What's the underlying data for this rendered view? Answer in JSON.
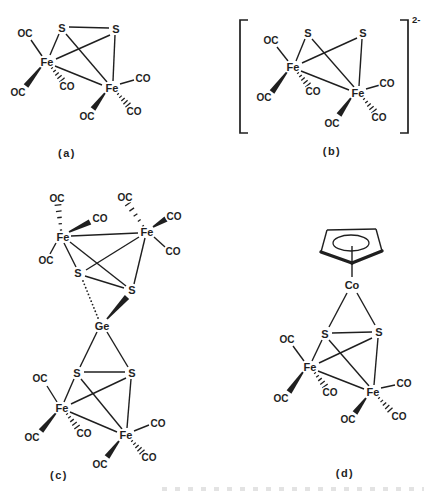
{
  "page": {
    "background": "#ffffff",
    "ink": "#1f1f1f",
    "artifact_color": "#c9c9c9"
  },
  "figure": {
    "type": "chemical-structure-diagram",
    "structures": [
      {
        "id": "a",
        "caption": "(a)",
        "caption_pos": [
          67,
          153
        ],
        "atoms": [
          {
            "t": "S",
            "x": 62,
            "y": 28,
            "k": "atom"
          },
          {
            "t": "S",
            "x": 116,
            "y": 29,
            "k": "atom"
          },
          {
            "t": "Fe",
            "x": 47,
            "y": 62,
            "k": "atom"
          },
          {
            "t": "Fe",
            "x": 112,
            "y": 88,
            "k": "atom"
          },
          {
            "t": "OC",
            "x": 25,
            "y": 33,
            "k": "lig"
          },
          {
            "t": "OC",
            "x": 18,
            "y": 92,
            "k": "lig"
          },
          {
            "t": "CO",
            "x": 67,
            "y": 86,
            "k": "lig"
          },
          {
            "t": "CO",
            "x": 143,
            "y": 78,
            "k": "lig"
          },
          {
            "t": "OC",
            "x": 87,
            "y": 116,
            "k": "lig"
          },
          {
            "t": "CO",
            "x": 134,
            "y": 111,
            "k": "lig"
          }
        ],
        "bonds": [
          [
            69,
            27,
            109,
            28,
            "plain"
          ],
          [
            59,
            34,
            50,
            55,
            "plain"
          ],
          [
            66,
            34,
            107,
            82,
            "plain"
          ],
          [
            110,
            35,
            56,
            59,
            "plain"
          ],
          [
            115,
            35,
            113,
            81,
            "plain"
          ],
          [
            55,
            66,
            102,
            85,
            "plain"
          ],
          [
            42,
            56,
            31,
            40,
            "plain"
          ],
          [
            41,
            67,
            26,
            86,
            "bold"
          ],
          [
            52,
            68,
            62,
            80,
            "hash"
          ],
          [
            120,
            84,
            134,
            80,
            "plain"
          ],
          [
            105,
            93,
            93,
            109,
            "bold"
          ],
          [
            118,
            94,
            128,
            105,
            "hash"
          ]
        ]
      },
      {
        "id": "b",
        "caption": "(b)",
        "caption_pos": [
          332,
          151
        ],
        "charge": {
          "text": "2-",
          "pos": [
            412,
            19
          ]
        },
        "brackets": [
          {
            "x": 240,
            "y1": 20,
            "y2": 133,
            "dir": 1
          },
          {
            "x": 408,
            "y1": 20,
            "y2": 133,
            "dir": -1
          }
        ],
        "atoms": [
          {
            "t": "S",
            "x": 308,
            "y": 33,
            "k": "atom"
          },
          {
            "t": "S",
            "x": 363,
            "y": 33,
            "k": "atom"
          },
          {
            "t": "Fe",
            "x": 293,
            "y": 67,
            "k": "atom"
          },
          {
            "t": "Fe",
            "x": 358,
            "y": 93,
            "k": "atom"
          },
          {
            "t": "OC",
            "x": 271,
            "y": 40,
            "k": "lig"
          },
          {
            "t": "OC",
            "x": 264,
            "y": 97,
            "k": "lig"
          },
          {
            "t": "CO",
            "x": 313,
            "y": 91,
            "k": "lig"
          },
          {
            "t": "CO",
            "x": 387,
            "y": 83,
            "k": "lig"
          },
          {
            "t": "OC",
            "x": 332,
            "y": 123,
            "k": "lig"
          },
          {
            "t": "CO",
            "x": 379,
            "y": 117,
            "k": "lig"
          }
        ],
        "bonds": [
          [
            305,
            39,
            296,
            61,
            "plain"
          ],
          [
            312,
            39,
            354,
            87,
            "plain"
          ],
          [
            357,
            38,
            302,
            63,
            "plain"
          ],
          [
            362,
            39,
            359,
            86,
            "plain"
          ],
          [
            301,
            71,
            349,
            90,
            "plain"
          ],
          [
            288,
            61,
            277,
            47,
            "plain"
          ],
          [
            287,
            72,
            272,
            92,
            "bold"
          ],
          [
            298,
            73,
            308,
            85,
            "hash"
          ],
          [
            366,
            89,
            380,
            85,
            "plain"
          ],
          [
            351,
            98,
            339,
            115,
            "bold"
          ],
          [
            364,
            99,
            374,
            111,
            "hash"
          ]
        ]
      },
      {
        "id": "c",
        "caption": "(c)",
        "caption_pos": [
          59,
          475
        ],
        "atoms": [
          {
            "t": "Fe",
            "x": 63,
            "y": 237,
            "k": "atom"
          },
          {
            "t": "Fe",
            "x": 147,
            "y": 232,
            "k": "atom"
          },
          {
            "t": "S",
            "x": 78,
            "y": 273,
            "k": "atom"
          },
          {
            "t": "S",
            "x": 132,
            "y": 290,
            "k": "atom"
          },
          {
            "t": "Ge",
            "x": 102,
            "y": 326,
            "k": "atom"
          },
          {
            "t": "S",
            "x": 77,
            "y": 373,
            "k": "atom"
          },
          {
            "t": "S",
            "x": 132,
            "y": 373,
            "k": "atom"
          },
          {
            "t": "Fe",
            "x": 62,
            "y": 408,
            "k": "atom"
          },
          {
            "t": "Fe",
            "x": 126,
            "y": 435,
            "k": "atom"
          },
          {
            "t": "OC",
            "x": 57,
            "y": 198,
            "k": "lig"
          },
          {
            "t": "CO",
            "x": 100,
            "y": 218,
            "k": "lig"
          },
          {
            "t": "OC",
            "x": 46,
            "y": 260,
            "k": "lig"
          },
          {
            "t": "OC",
            "x": 125,
            "y": 197,
            "k": "lig"
          },
          {
            "t": "CO",
            "x": 174,
            "y": 216,
            "k": "lig"
          },
          {
            "t": "CO",
            "x": 173,
            "y": 251,
            "k": "lig"
          },
          {
            "t": "OC",
            "x": 40,
            "y": 378,
            "k": "lig"
          },
          {
            "t": "OC",
            "x": 32,
            "y": 437,
            "k": "lig"
          },
          {
            "t": "CO",
            "x": 84,
            "y": 433,
            "k": "lig"
          },
          {
            "t": "CO",
            "x": 158,
            "y": 423,
            "k": "lig"
          },
          {
            "t": "OC",
            "x": 100,
            "y": 464,
            "k": "lig"
          },
          {
            "t": "CO",
            "x": 149,
            "y": 457,
            "k": "lig"
          }
        ],
        "bonds": [
          [
            71,
            236,
            138,
            233,
            "plain"
          ],
          [
            64,
            243,
            76,
            267,
            "plain"
          ],
          [
            70,
            242,
            126,
            286,
            "plain"
          ],
          [
            139,
            237,
            86,
            270,
            "plain"
          ],
          [
            145,
            238,
            134,
            284,
            "plain"
          ],
          [
            85,
            276,
            124,
            288,
            "plain"
          ],
          [
            83,
            281,
            98,
            318,
            "dots"
          ],
          [
            107,
            319,
            127,
            297,
            "bold"
          ],
          [
            61,
            230,
            58,
            205,
            "hash"
          ],
          [
            69,
            232,
            90,
            222,
            "bold"
          ],
          [
            56,
            243,
            50,
            254,
            "plain"
          ],
          [
            143,
            226,
            128,
            204,
            "hash"
          ],
          [
            153,
            227,
            166,
            219,
            "bold"
          ],
          [
            154,
            237,
            165,
            247,
            "plain"
          ],
          [
            97,
            332,
            80,
            367,
            "plain"
          ],
          [
            107,
            332,
            128,
            367,
            "plain"
          ],
          [
            84,
            372,
            125,
            372,
            "plain"
          ],
          [
            74,
            379,
            64,
            402,
            "plain"
          ],
          [
            81,
            379,
            122,
            429,
            "plain"
          ],
          [
            126,
            378,
            71,
            404,
            "plain"
          ],
          [
            131,
            379,
            127,
            428,
            "plain"
          ],
          [
            70,
            412,
            117,
            432,
            "plain"
          ],
          [
            57,
            402,
            47,
            386,
            "plain"
          ],
          [
            56,
            413,
            41,
            431,
            "bold"
          ],
          [
            67,
            414,
            77,
            427,
            "hash"
          ],
          [
            134,
            431,
            149,
            425,
            "plain"
          ],
          [
            119,
            441,
            107,
            457,
            "bold"
          ],
          [
            132,
            441,
            142,
            452,
            "hash"
          ]
        ]
      },
      {
        "id": "d",
        "caption": "(d)",
        "caption_pos": [
          345,
          473
        ],
        "cp_ring": {
          "edges": [
            [
              327,
              230,
              376,
              229,
              "plain"
            ],
            [
              321,
              252,
              327,
              230,
              "plain"
            ],
            [
              382,
              251,
              376,
              229,
              "plain"
            ],
            [
              321,
              252,
              352,
              263,
              "thick"
            ],
            [
              382,
              251,
              352,
              263,
              "thick"
            ]
          ],
          "ellipse": {
            "cx": 351,
            "cy": 243,
            "rx": 18,
            "ry": 8
          },
          "stem": [
            352,
            246,
            352,
            277,
            "plain"
          ]
        },
        "atoms": [
          {
            "t": "Co",
            "x": 352,
            "y": 285,
            "k": "atom"
          },
          {
            "t": "S",
            "x": 325,
            "y": 334,
            "k": "atom"
          },
          {
            "t": "S",
            "x": 379,
            "y": 332,
            "k": "atom"
          },
          {
            "t": "Fe",
            "x": 310,
            "y": 367,
            "k": "atom"
          },
          {
            "t": "Fe",
            "x": 373,
            "y": 392,
            "k": "atom"
          },
          {
            "t": "OC",
            "x": 287,
            "y": 339,
            "k": "lig"
          },
          {
            "t": "OC",
            "x": 281,
            "y": 398,
            "k": "lig"
          },
          {
            "t": "CO",
            "x": 330,
            "y": 392,
            "k": "lig"
          },
          {
            "t": "CO",
            "x": 404,
            "y": 383,
            "k": "lig"
          },
          {
            "t": "OC",
            "x": 348,
            "y": 419,
            "k": "lig"
          },
          {
            "t": "CO",
            "x": 399,
            "y": 416,
            "k": "lig"
          }
        ],
        "bonds": [
          [
            347,
            293,
            329,
            327,
            "plain"
          ],
          [
            357,
            293,
            375,
            325,
            "plain"
          ],
          [
            332,
            333,
            372,
            332,
            "plain"
          ],
          [
            322,
            340,
            312,
            361,
            "plain"
          ],
          [
            329,
            340,
            369,
            386,
            "plain"
          ],
          [
            372,
            338,
            319,
            363,
            "plain"
          ],
          [
            378,
            338,
            374,
            385,
            "plain"
          ],
          [
            318,
            371,
            364,
            389,
            "plain"
          ],
          [
            304,
            361,
            293,
            346,
            "plain"
          ],
          [
            303,
            372,
            289,
            392,
            "bold"
          ],
          [
            315,
            373,
            325,
            386,
            "hash"
          ],
          [
            381,
            388,
            395,
            385,
            "plain"
          ],
          [
            366,
            398,
            355,
            413,
            "bold"
          ],
          [
            379,
            398,
            390,
            410,
            "hash"
          ]
        ]
      }
    ]
  }
}
